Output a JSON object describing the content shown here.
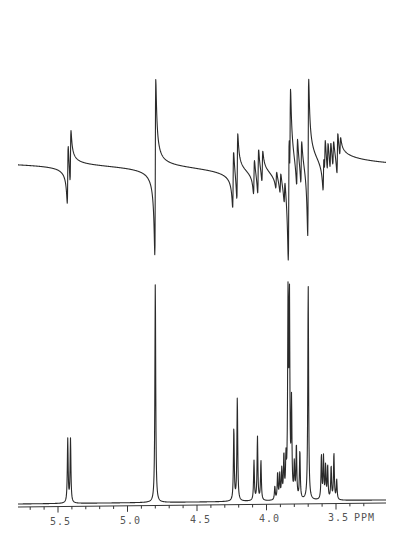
{
  "chart_data": {
    "type": "line",
    "title": "",
    "xlabel": "PPM",
    "ylabel": "",
    "x_axis": {
      "reversed": true,
      "range_ppm": [
        5.8,
        3.25
      ],
      "tick_labels": [
        "5.5",
        "5.0",
        "4.5",
        "4.0",
        "3.5"
      ],
      "tick_values": [
        5.5,
        5.0,
        4.5,
        4.0,
        3.5
      ],
      "unit_label": "PPM",
      "minor_tick_step": 0.1
    },
    "grid": false,
    "legend": null,
    "series": [
      {
        "name": "dispersion-mode spectrum (top trace)",
        "mode": "dispersion",
        "baseline_relative": 0,
        "peaks": [
          {
            "ppm": 5.43,
            "amplitude": 0.34
          },
          {
            "ppm": 5.41,
            "amplitude": 0.3
          },
          {
            "ppm": 4.8,
            "amplitude": 1.0
          },
          {
            "ppm": 4.24,
            "amplitude": 0.33
          },
          {
            "ppm": 4.21,
            "amplitude": 0.38
          },
          {
            "ppm": 4.09,
            "amplitude": 0.2
          },
          {
            "ppm": 4.06,
            "amplitude": 0.26
          },
          {
            "ppm": 4.03,
            "amplitude": 0.18
          },
          {
            "ppm": 3.93,
            "amplitude": 0.1
          },
          {
            "ppm": 3.9,
            "amplitude": 0.12
          },
          {
            "ppm": 3.87,
            "amplitude": 0.14
          },
          {
            "ppm": 3.84,
            "amplitude": 0.8
          },
          {
            "ppm": 3.83,
            "amplitude": 0.55
          },
          {
            "ppm": 3.78,
            "amplitude": 0.28
          },
          {
            "ppm": 3.75,
            "amplitude": 0.25
          },
          {
            "ppm": 3.7,
            "amplitude": 0.9
          },
          {
            "ppm": 3.59,
            "amplitude": 0.22
          },
          {
            "ppm": 3.58,
            "amplitude": 0.2
          },
          {
            "ppm": 3.56,
            "amplitude": 0.17
          },
          {
            "ppm": 3.54,
            "amplitude": 0.16
          },
          {
            "ppm": 3.52,
            "amplitude": 0.15
          },
          {
            "ppm": 3.49,
            "amplitude": 0.24
          },
          {
            "ppm": 3.47,
            "amplitude": 0.11
          }
        ]
      },
      {
        "name": "absorption-mode spectrum (bottom trace)",
        "mode": "absorption",
        "peaks": [
          {
            "ppm": 5.43,
            "height": 0.29
          },
          {
            "ppm": 5.41,
            "height": 0.29
          },
          {
            "ppm": 4.8,
            "height": 1.0
          },
          {
            "ppm": 4.235,
            "height": 0.33
          },
          {
            "ppm": 4.21,
            "height": 0.47
          },
          {
            "ppm": 4.09,
            "height": 0.18
          },
          {
            "ppm": 4.065,
            "height": 0.29
          },
          {
            "ppm": 4.04,
            "height": 0.18
          },
          {
            "ppm": 3.94,
            "height": 0.06
          },
          {
            "ppm": 3.92,
            "height": 0.12
          },
          {
            "ppm": 3.905,
            "height": 0.11
          },
          {
            "ppm": 3.89,
            "height": 0.13
          },
          {
            "ppm": 3.875,
            "height": 0.19
          },
          {
            "ppm": 3.86,
            "height": 0.16
          },
          {
            "ppm": 3.845,
            "height": 0.89
          },
          {
            "ppm": 3.835,
            "height": 0.88
          },
          {
            "ppm": 3.82,
            "height": 0.42
          },
          {
            "ppm": 3.8,
            "height": 0.15
          },
          {
            "ppm": 3.785,
            "height": 0.24
          },
          {
            "ppm": 3.76,
            "height": 0.22
          },
          {
            "ppm": 3.7,
            "height": 0.98
          },
          {
            "ppm": 3.605,
            "height": 0.2
          },
          {
            "ppm": 3.59,
            "height": 0.19
          },
          {
            "ppm": 3.575,
            "height": 0.15
          },
          {
            "ppm": 3.56,
            "height": 0.15
          },
          {
            "ppm": 3.535,
            "height": 0.15
          },
          {
            "ppm": 3.515,
            "height": 0.21
          },
          {
            "ppm": 3.495,
            "height": 0.09
          }
        ]
      }
    ]
  },
  "axis": {
    "labels": [
      "5.5",
      "5.0",
      "4.5",
      "4.0",
      "3.5"
    ],
    "unit": "PPM"
  },
  "style": {
    "trace_color": "#2a2a2a",
    "background": "#ffffff"
  }
}
